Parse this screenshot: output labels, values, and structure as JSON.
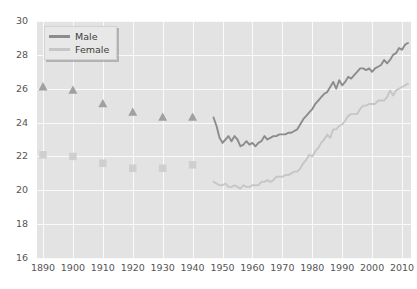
{
  "chart_data": {
    "type": "line",
    "title": "",
    "subtitle": "",
    "xlabel": "",
    "ylabel": "",
    "xlim": [
      1888,
      2013
    ],
    "ylim": [
      16,
      30
    ],
    "ytick_values": [
      16,
      18,
      20,
      22,
      24,
      26,
      28,
      30
    ],
    "ytick_labels": [
      "16",
      "18",
      "20",
      "22",
      "24",
      "26",
      "28",
      "30"
    ],
    "xtick_values": [
      1890,
      1900,
      1910,
      1920,
      1930,
      1940,
      1950,
      1960,
      1970,
      1980,
      1990,
      2000,
      2010
    ],
    "xtick_labels": [
      "1890",
      "1900",
      "1910",
      "1920",
      "1930",
      "1940",
      "1950",
      "1960",
      "1970",
      "1980",
      "1990",
      "2000",
      "2010"
    ],
    "grid": true,
    "grid_color": "#fafafa",
    "plot_background": "#e3e3e3",
    "legend_position": "top-left",
    "legend": [
      "Male",
      "Female"
    ],
    "series": [
      {
        "name": "Male",
        "color": "#8c8c8c",
        "marker": "triangle",
        "marker_color": "#a0a0a0",
        "marker_points": {
          "x": [
            1890,
            1900,
            1910,
            1920,
            1930,
            1940
          ],
          "y": [
            26.1,
            25.9,
            25.1,
            24.6,
            24.3,
            24.3
          ]
        },
        "line_points": {
          "x": [
            1947,
            1948,
            1949,
            1950,
            1951,
            1952,
            1953,
            1954,
            1955,
            1956,
            1957,
            1958,
            1959,
            1960,
            1961,
            1962,
            1963,
            1964,
            1965,
            1966,
            1967,
            1968,
            1969,
            1970,
            1971,
            1972,
            1973,
            1974,
            1975,
            1976,
            1977,
            1978,
            1979,
            1980,
            1981,
            1982,
            1983,
            1984,
            1985,
            1986,
            1987,
            1988,
            1989,
            1990,
            1991,
            1992,
            1993,
            1994,
            1995,
            1996,
            1997,
            1998,
            1999,
            2000,
            2001,
            2002,
            2003,
            2004,
            2005,
            2006,
            2007,
            2008,
            2009,
            2010,
            2011,
            2012
          ],
          "y": [
            24.3,
            23.8,
            23.1,
            22.8,
            23.0,
            23.2,
            22.9,
            23.2,
            23.0,
            22.6,
            22.7,
            22.9,
            22.7,
            22.8,
            22.6,
            22.8,
            22.9,
            23.2,
            23.0,
            23.1,
            23.2,
            23.2,
            23.3,
            23.3,
            23.3,
            23.4,
            23.4,
            23.5,
            23.6,
            23.9,
            24.2,
            24.4,
            24.6,
            24.8,
            25.1,
            25.3,
            25.5,
            25.7,
            25.8,
            26.1,
            26.4,
            26.0,
            26.5,
            26.2,
            26.4,
            26.7,
            26.6,
            26.8,
            27.0,
            27.2,
            27.2,
            27.1,
            27.2,
            27.0,
            27.2,
            27.3,
            27.4,
            27.7,
            27.5,
            27.7,
            28.0,
            28.1,
            28.4,
            28.3,
            28.6,
            28.7
          ]
        }
      },
      {
        "name": "Female",
        "color": "#c6c6c6",
        "marker": "square",
        "marker_color": "#cfcfcf",
        "marker_points": {
          "x": [
            1890,
            1900,
            1910,
            1920,
            1930,
            1940
          ],
          "y": [
            22.1,
            22.0,
            21.6,
            21.3,
            21.3,
            21.5
          ]
        },
        "line_points": {
          "x": [
            1947,
            1948,
            1949,
            1950,
            1951,
            1952,
            1953,
            1954,
            1955,
            1956,
            1957,
            1958,
            1959,
            1960,
            1961,
            1962,
            1963,
            1964,
            1965,
            1966,
            1967,
            1968,
            1969,
            1970,
            1971,
            1972,
            1973,
            1974,
            1975,
            1976,
            1977,
            1978,
            1979,
            1980,
            1981,
            1982,
            1983,
            1984,
            1985,
            1986,
            1987,
            1988,
            1989,
            1990,
            1991,
            1992,
            1993,
            1994,
            1995,
            1996,
            1997,
            1998,
            1999,
            2000,
            2001,
            2002,
            2003,
            2004,
            2005,
            2006,
            2007,
            2008,
            2009,
            2010,
            2011,
            2012
          ],
          "y": [
            20.5,
            20.4,
            20.3,
            20.3,
            20.4,
            20.2,
            20.2,
            20.3,
            20.2,
            20.1,
            20.3,
            20.2,
            20.2,
            20.3,
            20.3,
            20.3,
            20.5,
            20.5,
            20.6,
            20.5,
            20.6,
            20.8,
            20.8,
            20.8,
            20.9,
            20.9,
            21.0,
            21.1,
            21.1,
            21.3,
            21.6,
            21.8,
            22.1,
            22.0,
            22.3,
            22.5,
            22.8,
            23.0,
            23.3,
            23.1,
            23.6,
            23.6,
            23.8,
            23.9,
            24.1,
            24.4,
            24.5,
            24.5,
            24.5,
            24.8,
            25.0,
            25.0,
            25.1,
            25.1,
            25.1,
            25.3,
            25.3,
            25.3,
            25.5,
            25.9,
            25.6,
            25.9,
            26.0,
            26.1,
            26.2,
            26.3
          ]
        }
      }
    ]
  },
  "legend": {
    "male_label": "Male",
    "female_label": "Female"
  }
}
